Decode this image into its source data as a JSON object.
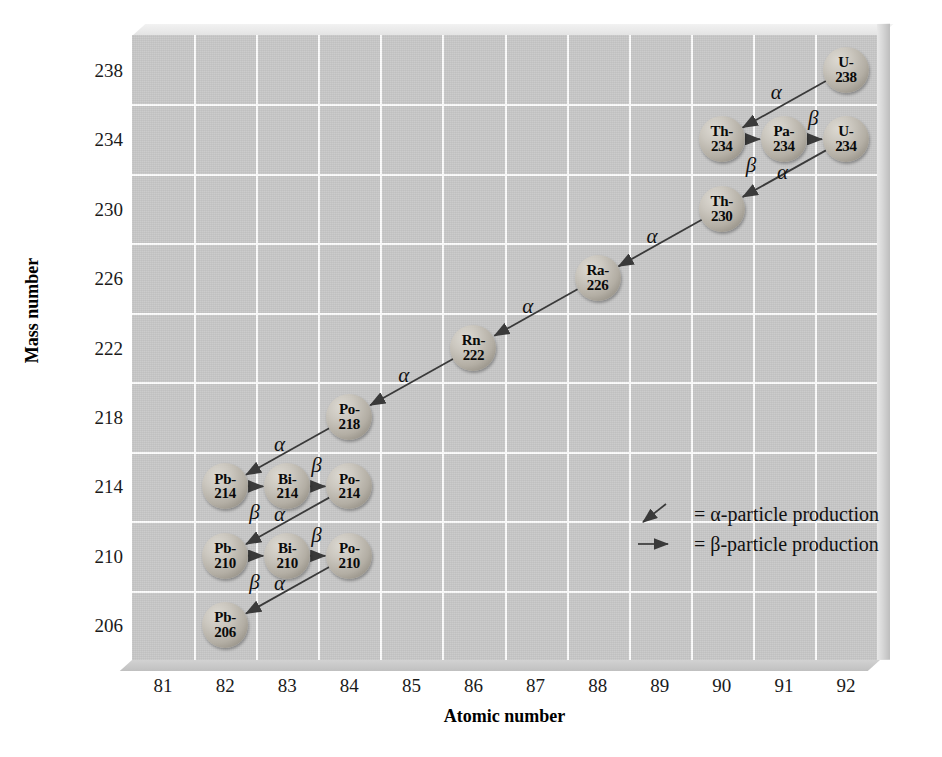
{
  "figure": {
    "panel_color": "#c8c8c8",
    "grid_color": "#fdfdfd",
    "bubble_color": "#b3aea4",
    "arrow_color": "#3a3a3a"
  },
  "axes": {
    "xlabel": "Atomic number",
    "ylabel": "Mass number",
    "xticks": [
      "81",
      "82",
      "83",
      "84",
      "85",
      "86",
      "87",
      "88",
      "89",
      "90",
      "91",
      "92"
    ],
    "yticks": [
      "238",
      "234",
      "230",
      "226",
      "222",
      "218",
      "214",
      "210",
      "206"
    ]
  },
  "legend": {
    "items": [
      {
        "glyph": "alpha-arrow-icon",
        "text": "= α-particle production"
      },
      {
        "glyph": "beta-arrow-icon",
        "text": "= β-particle production"
      }
    ]
  },
  "chart_data": {
    "type": "scatter",
    "xlabel": "Atomic number",
    "ylabel": "Mass number",
    "xlim": [
      80.5,
      92.5
    ],
    "ylim": [
      204,
      240
    ],
    "xticks": [
      81,
      82,
      83,
      84,
      85,
      86,
      87,
      88,
      89,
      90,
      91,
      92
    ],
    "yticks": [
      238,
      234,
      230,
      226,
      222,
      218,
      214,
      210,
      206
    ],
    "grid": true,
    "legend_position": "center-right",
    "nuclides": [
      {
        "id": "U-238",
        "sym": "U-",
        "mass": "238",
        "z": 92,
        "a": 238
      },
      {
        "id": "Th-234",
        "sym": "Th-",
        "mass": "234",
        "z": 90,
        "a": 234
      },
      {
        "id": "Pa-234",
        "sym": "Pa-",
        "mass": "234",
        "z": 91,
        "a": 234
      },
      {
        "id": "U-234",
        "sym": "U-",
        "mass": "234",
        "z": 92,
        "a": 234
      },
      {
        "id": "Th-230",
        "sym": "Th-",
        "mass": "230",
        "z": 90,
        "a": 230
      },
      {
        "id": "Ra-226",
        "sym": "Ra-",
        "mass": "226",
        "z": 88,
        "a": 226
      },
      {
        "id": "Rn-222",
        "sym": "Rn-",
        "mass": "222",
        "z": 86,
        "a": 222
      },
      {
        "id": "Po-218",
        "sym": "Po-",
        "mass": "218",
        "z": 84,
        "a": 218
      },
      {
        "id": "Pb-214",
        "sym": "Pb-",
        "mass": "214",
        "z": 82,
        "a": 214
      },
      {
        "id": "Bi-214",
        "sym": "Bi-",
        "mass": "214",
        "z": 83,
        "a": 214
      },
      {
        "id": "Po-214",
        "sym": "Po-",
        "mass": "214",
        "z": 84,
        "a": 214
      },
      {
        "id": "Pb-210",
        "sym": "Pb-",
        "mass": "210",
        "z": 82,
        "a": 210
      },
      {
        "id": "Bi-210",
        "sym": "Bi-",
        "mass": "210",
        "z": 83,
        "a": 210
      },
      {
        "id": "Po-210",
        "sym": "Po-",
        "mass": "210",
        "z": 84,
        "a": 210
      },
      {
        "id": "Pb-206",
        "sym": "Pb-",
        "mass": "206",
        "z": 82,
        "a": 206
      }
    ],
    "decays": [
      {
        "from": "U-238",
        "to": "Th-234",
        "type": "α",
        "label": "α"
      },
      {
        "from": "Th-234",
        "to": "Pa-234",
        "type": "β",
        "label": "β"
      },
      {
        "from": "Pa-234",
        "to": "U-234",
        "type": "β",
        "label": "β"
      },
      {
        "from": "U-234",
        "to": "Th-230",
        "type": "α",
        "label": "α"
      },
      {
        "from": "Th-230",
        "to": "Ra-226",
        "type": "α",
        "label": "α"
      },
      {
        "from": "Ra-226",
        "to": "Rn-222",
        "type": "α",
        "label": "α"
      },
      {
        "from": "Rn-222",
        "to": "Po-218",
        "type": "α",
        "label": "α"
      },
      {
        "from": "Po-218",
        "to": "Pb-214",
        "type": "α",
        "label": "α"
      },
      {
        "from": "Pb-214",
        "to": "Bi-214",
        "type": "β",
        "label": "β"
      },
      {
        "from": "Bi-214",
        "to": "Po-214",
        "type": "β",
        "label": "β"
      },
      {
        "from": "Po-214",
        "to": "Pb-210",
        "type": "α",
        "label": "α"
      },
      {
        "from": "Pb-210",
        "to": "Bi-210",
        "type": "β",
        "label": "β"
      },
      {
        "from": "Bi-210",
        "to": "Po-210",
        "type": "β",
        "label": "β"
      },
      {
        "from": "Po-210",
        "to": "Pb-206",
        "type": "α",
        "label": "α"
      }
    ],
    "decay_label_positions": [
      {
        "label": "α",
        "x": 90.9,
        "y": 236.6
      },
      {
        "label": "β",
        "x": 90.5,
        "y": 232.4
      },
      {
        "label": "β",
        "x": 91.5,
        "y": 235.1
      },
      {
        "label": "α",
        "x": 91.0,
        "y": 232.0
      },
      {
        "label": "α",
        "x": 88.9,
        "y": 228.3
      },
      {
        "label": "α",
        "x": 86.9,
        "y": 224.3
      },
      {
        "label": "α",
        "x": 84.9,
        "y": 220.3
      },
      {
        "label": "α",
        "x": 82.9,
        "y": 216.3
      },
      {
        "label": "β",
        "x": 82.5,
        "y": 212.4
      },
      {
        "label": "β",
        "x": 83.5,
        "y": 215.1
      },
      {
        "label": "α",
        "x": 82.9,
        "y": 212.3
      },
      {
        "label": "β",
        "x": 82.5,
        "y": 208.4
      },
      {
        "label": "β",
        "x": 83.5,
        "y": 211.1
      },
      {
        "label": "α",
        "x": 82.9,
        "y": 208.3
      }
    ]
  }
}
